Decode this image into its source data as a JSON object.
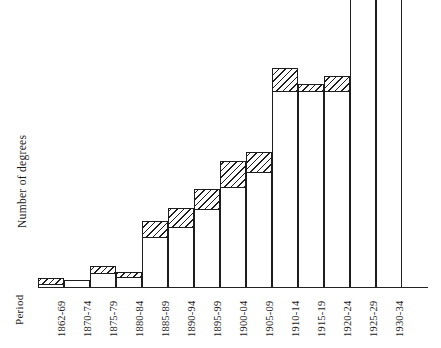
{
  "axes": {
    "ylabel": "Number of degrees",
    "period_label": "Period"
  },
  "chart_data": {
    "type": "bar",
    "title": "",
    "xlabel": "Period",
    "ylabel": "Number of degrees",
    "grid": false,
    "legend": "none",
    "note": "Each bar is drawn with an open (white) lower portion and a diagonally hatched upper portion; the two right-most bars extend past the top edge of the figure and are clipped.",
    "categories": [
      "1862-69",
      "1870-74",
      "1875-79",
      "1880-84",
      "1885-89",
      "1890-94",
      "1895-99",
      "1900-04",
      "1905-09",
      "1910-14",
      "1915-19",
      "1920-24",
      "1925-29",
      "1930-34"
    ],
    "series": [
      {
        "name": "open (lower) portion",
        "values": [
          3,
          7,
          14,
          15,
          50,
          60,
          78,
          100,
          115,
          196,
          203,
          196,
          288,
          288
        ]
      },
      {
        "name": "hatched (upper) portion",
        "values": [
          6,
          0,
          7,
          5,
          16,
          19,
          20,
          26,
          20,
          23,
          7,
          15,
          0,
          0
        ]
      }
    ],
    "totals": [
      9,
      7,
      21,
      20,
      66,
      79,
      98,
      126,
      135,
      219,
      210,
      211,
      288,
      288
    ],
    "ylim": [
      0,
      288
    ],
    "ylim_note": "values expressed in pixel-height units read off the figure; no numeric y tick labels are printed on the chart",
    "yticks": [],
    "clipped_bars": [
      "1925-29",
      "1930-34"
    ]
  },
  "bars": [
    {
      "label": "1862-69",
      "x": 0,
      "w": 26,
      "top": 278,
      "hatch_bottom": 284
    },
    {
      "label": "1870-74",
      "x": 26,
      "w": 26,
      "top": 280,
      "hatch_bottom": 280
    },
    {
      "label": "1875-79",
      "x": 52,
      "w": 26,
      "top": 266,
      "hatch_bottom": 273
    },
    {
      "label": "1880-84",
      "x": 78,
      "w": 26,
      "top": 272,
      "hatch_bottom": 277
    },
    {
      "label": "1885-89",
      "x": 104,
      "w": 26,
      "top": 221,
      "hatch_bottom": 237
    },
    {
      "label": "1890-94",
      "x": 130,
      "w": 26,
      "top": 208,
      "hatch_bottom": 227
    },
    {
      "label": "1895-99",
      "x": 156,
      "w": 26,
      "top": 189,
      "hatch_bottom": 209
    },
    {
      "label": "1900-04",
      "x": 182,
      "w": 26,
      "top": 161,
      "hatch_bottom": 187
    },
    {
      "label": "1905-09",
      "x": 208,
      "w": 26,
      "top": 152,
      "hatch_bottom": 172
    },
    {
      "label": "1910-14",
      "x": 234,
      "w": 26,
      "top": 68,
      "hatch_bottom": 91
    },
    {
      "label": "1915-19",
      "x": 260,
      "w": 26,
      "top": 84,
      "hatch_bottom": 91
    },
    {
      "label": "1920-24",
      "x": 286,
      "w": 26,
      "top": 76,
      "hatch_bottom": 91
    },
    {
      "label": "1925-29",
      "x": 312,
      "w": 26,
      "top": -1,
      "hatch_bottom": -1
    },
    {
      "label": "1930-34",
      "x": 338,
      "w": 26,
      "top": -1,
      "hatch_bottom": -1
    }
  ]
}
